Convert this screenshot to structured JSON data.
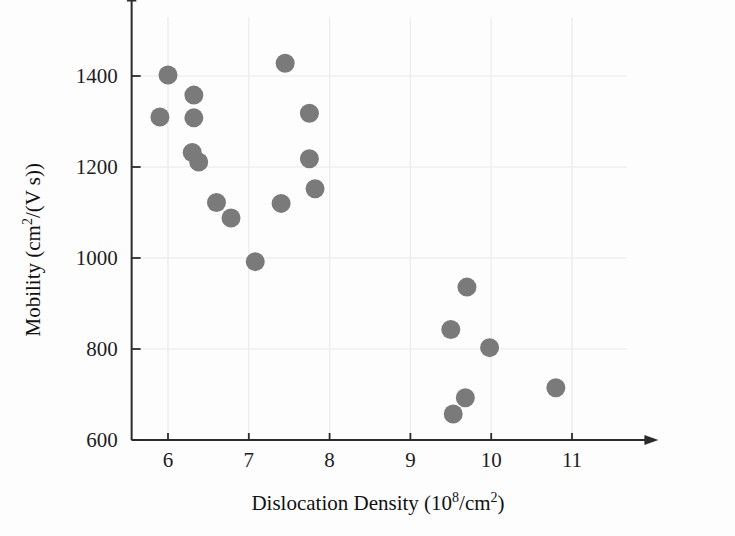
{
  "chart_data": {
    "type": "scatter",
    "title": "",
    "xlabel": "Dislocation Density (10^8 /cm^2)",
    "ylabel": "Mobility (cm^2/(V s))",
    "xlabel_parts": {
      "main": "Dislocation Density (10",
      "exp": "8",
      "tail": "/cm",
      "exp2": "2",
      "close": ")"
    },
    "ylabel_parts": {
      "main": "Mobility (cm",
      "exp": "2",
      "tail": "/(V s))"
    },
    "xlim": [
      5.55,
      11.45
    ],
    "ylim": [
      600,
      1480
    ],
    "xticks": [
      6,
      7,
      8,
      9,
      10,
      11
    ],
    "xtick_labels": [
      "6",
      "7",
      "8",
      "9",
      "10",
      "11"
    ],
    "yticks": [
      600,
      800,
      1000,
      1200,
      1400
    ],
    "ytick_labels": [
      "600",
      "800",
      "1000",
      "1200",
      "1400"
    ],
    "grid": true,
    "legend": null,
    "marker": {
      "shape": "circle",
      "color": "#7a7a7a",
      "size_px": 19
    },
    "points": [
      {
        "x": 5.9,
        "y": 1310
      },
      {
        "x": 6.0,
        "y": 1402
      },
      {
        "x": 6.32,
        "y": 1358
      },
      {
        "x": 6.32,
        "y": 1308
      },
      {
        "x": 6.3,
        "y": 1232
      },
      {
        "x": 6.38,
        "y": 1211
      },
      {
        "x": 6.6,
        "y": 1122
      },
      {
        "x": 6.78,
        "y": 1088
      },
      {
        "x": 7.08,
        "y": 992
      },
      {
        "x": 7.4,
        "y": 1120
      },
      {
        "x": 7.45,
        "y": 1428
      },
      {
        "x": 7.75,
        "y": 1318
      },
      {
        "x": 7.75,
        "y": 1218
      },
      {
        "x": 7.82,
        "y": 1152
      },
      {
        "x": 9.53,
        "y": 657
      },
      {
        "x": 9.5,
        "y": 843
      },
      {
        "x": 9.68,
        "y": 693
      },
      {
        "x": 9.7,
        "y": 936
      },
      {
        "x": 9.98,
        "y": 803
      },
      {
        "x": 10.8,
        "y": 715
      }
    ]
  }
}
